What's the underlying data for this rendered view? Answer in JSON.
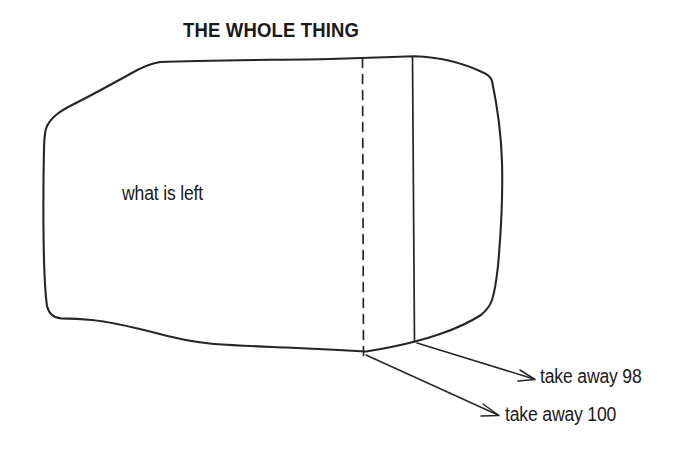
{
  "diagram": {
    "title": "THE WHOLE THING",
    "inside_label": "what is left",
    "annotations": [
      {
        "id": "take-away-98",
        "text": "take away 98"
      },
      {
        "id": "take-away-100",
        "text": "take away 100"
      }
    ],
    "colors": {
      "ink": "#262626",
      "text": "#1a1a1a",
      "background": "#ffffff"
    },
    "shape": {
      "kind": "hand-drawn-blob",
      "description": "irregular rounded quadrilateral representing a whole quantity",
      "dividers": [
        {
          "id": "dashed-divider",
          "style": "dashed",
          "meaning": "take away 100 boundary"
        },
        {
          "id": "solid-divider",
          "style": "solid",
          "meaning": "take away 98 boundary"
        }
      ]
    }
  }
}
